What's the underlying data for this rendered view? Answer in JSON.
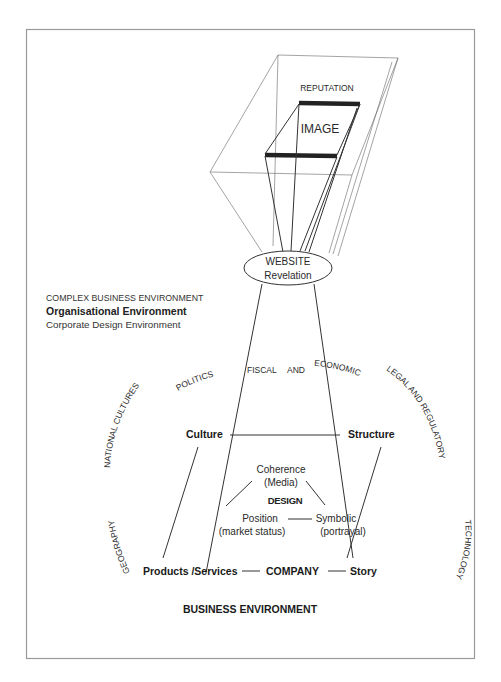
{
  "diagram": {
    "frustum": {
      "outer_label": "REPUTATION",
      "inner_label": "IMAGE"
    },
    "website": {
      "line1": "WEBSITE",
      "line2": "Revelation"
    },
    "legend": {
      "line1": "COMPLEX BUSINESS ENVIRONMENT",
      "line2": "Organisational Environment",
      "line3": "Corporate Design Environment"
    },
    "arc_labels": {
      "politics": "POLITICS",
      "fiscal": "FISCAL  AND  ECONOMIC",
      "national_cultures": "NATIONAL CULTURES",
      "geography": "GEOGRAPHY",
      "legal": "LEGAL  AND REGULATORY",
      "technology": "TECHNOLOGY"
    },
    "nodes": {
      "culture": "Culture",
      "structure": "Structure",
      "products": "Products /Services",
      "company": "COMPANY",
      "story": "Story"
    },
    "design": {
      "title": "DESIGN",
      "coherence": "Coherence",
      "coherence_sub": "(Media)",
      "position": "Position",
      "position_sub": "(market status)",
      "symbolic": "Symbolic",
      "symbolic_sub": "(portrayal)"
    },
    "footer": "BUSINESS ENVIRONMENT"
  }
}
